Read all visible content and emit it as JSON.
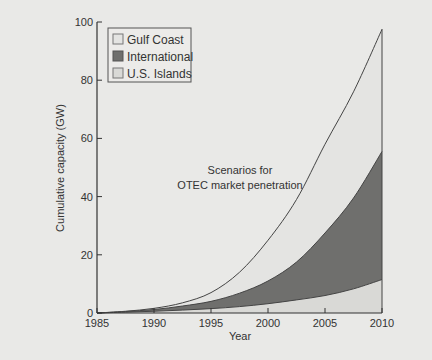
{
  "chart_data": {
    "type": "area",
    "stacked": true,
    "title": "",
    "annotation": "Scenarios for\nOTEC market penetration",
    "annotation_lines": [
      "Scenarios for",
      "OTEC market penetration"
    ],
    "xlabel": "Year",
    "ylabel": "Cumulative capacity (GW)",
    "xlim": [
      1985,
      2010
    ],
    "ylim": [
      0,
      100
    ],
    "x_ticks": [
      1985,
      1990,
      1995,
      2000,
      2005,
      2010
    ],
    "y_ticks": [
      0,
      20,
      40,
      60,
      80,
      100
    ],
    "grid": false,
    "legend_position": "upper-left",
    "x": [
      1985,
      1987.5,
      1990,
      1992.5,
      1995,
      1997.5,
      2000,
      2002.5,
      2005,
      2007.5,
      2010
    ],
    "series": [
      {
        "name": "U.S. Islands",
        "color": "#d9d9d6",
        "cumulative_top": [
          0,
          0.3,
          0.6,
          1.0,
          1.5,
          2.2,
          3.2,
          4.5,
          6.0,
          8.3,
          11.5
        ]
      },
      {
        "name": "International",
        "color": "#6f6f6d",
        "cumulative_top": [
          0,
          0.5,
          1.2,
          2.4,
          4.0,
          6.8,
          11.0,
          17.5,
          27.5,
          39.5,
          55.5
        ]
      },
      {
        "name": "Gulf Coast",
        "color": "#e4e4e2",
        "cumulative_top": [
          0,
          0.6,
          1.6,
          3.5,
          7.0,
          14.0,
          25.0,
          39.0,
          58.0,
          76.0,
          97.5
        ]
      }
    ]
  },
  "legend": {
    "items": [
      {
        "label": "Gulf Coast",
        "color": "#e4e4e2"
      },
      {
        "label": "International",
        "color": "#6f6f6d"
      },
      {
        "label": "U.S. Islands",
        "color": "#d9d9d6"
      }
    ]
  }
}
